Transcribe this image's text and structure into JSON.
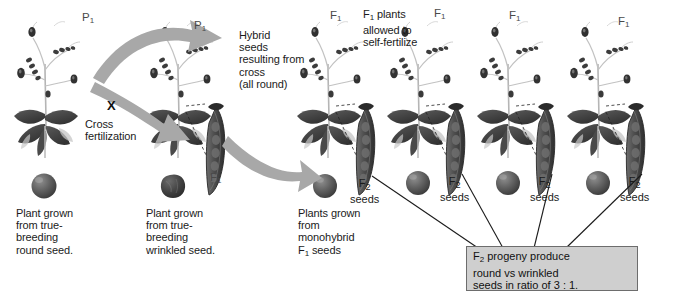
{
  "diagram": {
    "title_context": "Mendel monohybrid cross of pea plants",
    "background_color": "#ffffff",
    "arrow_color": "#a8a8a8",
    "leaf_color": "#4a4a4a",
    "seed_round_color": "#5d5d5d",
    "seed_wrinkled_color": "#3d3d3d",
    "line_color": "#1b1b1b",
    "box_fill": "#cfcfcf",
    "box_border": "#6d6d6d"
  },
  "generation_labels": {
    "p1_left": "P",
    "p1_left_sub": "1",
    "p1_right": "P",
    "p1_right_sub": "1",
    "f1_pod_left": "F",
    "f1_pod_left_sub": "1",
    "f1_plants": [
      {
        "label": "F",
        "sub": "1"
      },
      {
        "label": "F",
        "sub": "1"
      },
      {
        "label": "F",
        "sub": "1"
      },
      {
        "label": "F",
        "sub": "1"
      }
    ]
  },
  "annotations": {
    "cross_symbol": "X",
    "cross_fertilization": "Cross\nfertilization",
    "hybrid_seeds": "Hybrid\nseeds\nresulting from\ncross\n(all round)",
    "f1_self_fertilize_prefix": "F",
    "f1_self_fertilize_sub": "1",
    "f1_self_fertilize_rest": " plants\nallowed to\nself-fertilize",
    "caption_left": "Plant grown\nfrom true-\nbreeding\nround seed.",
    "caption_middle": "Plant grown\nfrom true-\nbreeding\nwrinkled seed.",
    "caption_right_line1": "Plants grown",
    "caption_right_line2": "from",
    "caption_right_line3": "monohybrid",
    "caption_right_line4_prefix": "F",
    "caption_right_line4_sub": "1",
    "caption_right_line4_rest": " seeds"
  },
  "f2_seed_labels": [
    {
      "gen": "F",
      "sub": "2",
      "word": "seeds"
    },
    {
      "gen": "F",
      "sub": "2",
      "word": "seeds"
    },
    {
      "gen": "F",
      "sub": "2",
      "word": "seeds"
    },
    {
      "gen": "F",
      "sub": "2",
      "word": "seeds"
    }
  ],
  "ratio_box": {
    "line1_prefix": "F",
    "line1_sub": "2",
    "line1_rest": " progeny produce",
    "line2": "round vs wrinkled",
    "line3": "seeds in ratio of 3 : 1."
  }
}
